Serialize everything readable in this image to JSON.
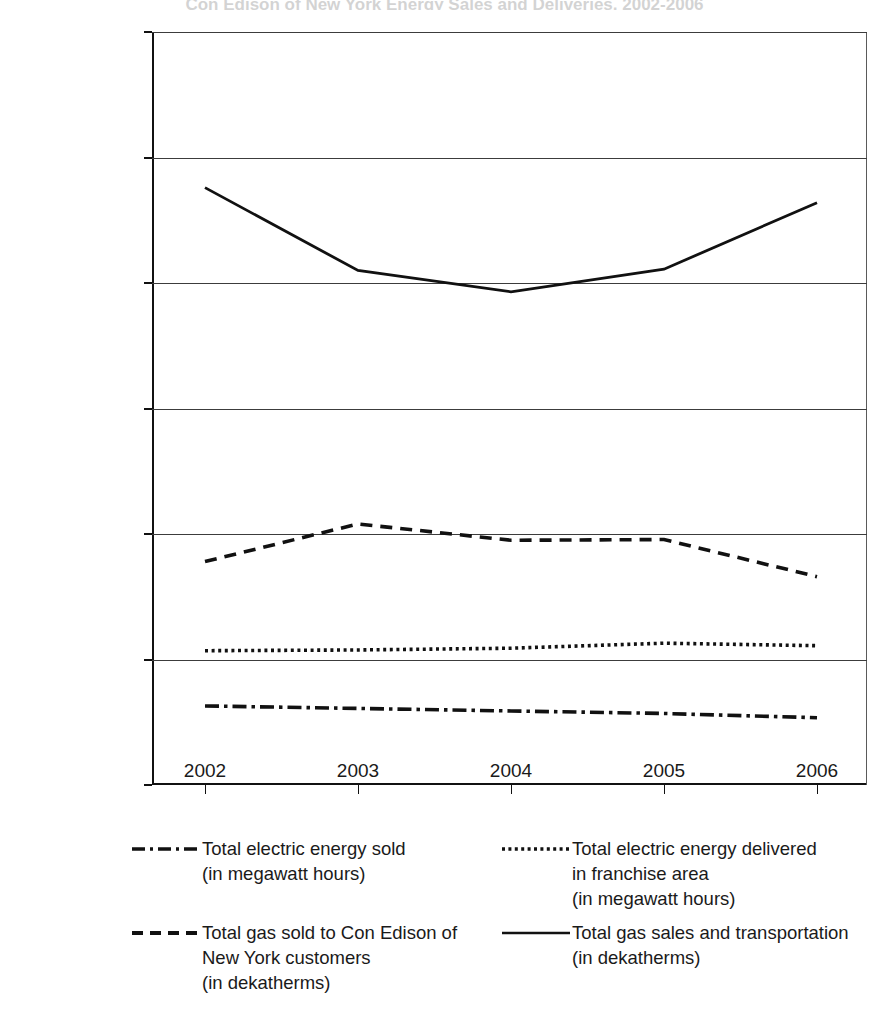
{
  "title_remnant": "Con Edison of New York Energy Sales and Deliveries, 2002-2006",
  "chart_data": {
    "type": "line",
    "title": "",
    "xlabel": "",
    "ylabel": "",
    "x": [
      "2002",
      "2003",
      "2004",
      "2005",
      "2006"
    ],
    "ylim": [
      0,
      300000000
    ],
    "yticks": [
      0,
      50000000,
      100000000,
      150000000,
      200000000,
      250000000,
      300000000
    ],
    "ytick_labels": [
      "0",
      "50,000,000",
      "100,000,000",
      "150,000,000",
      "200,000,000",
      "250,000,000",
      "300,000,000"
    ],
    "grid": true,
    "legend_position": "below",
    "series": [
      {
        "name": "Total electric energy sold\n(in megawatt hours)",
        "style": "dash-dot",
        "values": [
          31500000,
          30500000,
          29500000,
          28500000,
          26800000
        ]
      },
      {
        "name": "Total electric energy delivered\nin franchise area\n(in megawatt hours)",
        "style": "dotted",
        "values": [
          53500000,
          53800000,
          54500000,
          56500000,
          55500000
        ]
      },
      {
        "name": "Total gas sold to Con Edison of\nNew York customers\n(in dekatherms)",
        "style": "dashed",
        "values": [
          89000000,
          104000000,
          97500000,
          97800000,
          83000000
        ]
      },
      {
        "name": "Total gas sales and transportation\n(in dekatherms)",
        "style": "solid",
        "values": [
          238000000,
          205000000,
          196500000,
          205500000,
          232000000
        ]
      }
    ]
  },
  "legend": {
    "items": [
      {
        "key": "dash-dot-line-key",
        "label": "Total electric energy sold\n(in megawatt hours)"
      },
      {
        "key": "dotted-line-key",
        "label": "Total electric energy delivered\nin franchise area\n(in megawatt hours)"
      },
      {
        "key": "dashed-line-key",
        "label": "Total gas sold to Con Edison of\nNew York customers\n(in dekatherms)"
      },
      {
        "key": "solid-line-key",
        "label": "Total gas sales and transportation\n(in dekatherms)"
      }
    ]
  },
  "colors": {
    "line": "#111111",
    "grid": "#3c3c3c",
    "background": "#ffffff"
  }
}
